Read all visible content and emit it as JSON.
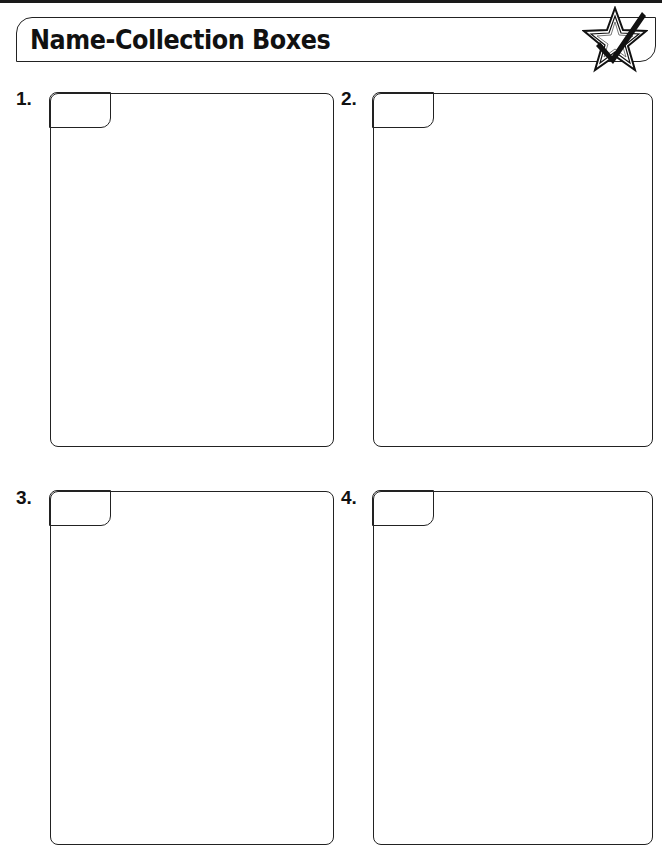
{
  "header": {
    "title": "Name-Collection Boxes",
    "icon": "star-checkmark-icon"
  },
  "boxes": [
    {
      "number": "1.",
      "name_tab": ""
    },
    {
      "number": "2.",
      "name_tab": ""
    },
    {
      "number": "3.",
      "name_tab": ""
    },
    {
      "number": "4.",
      "name_tab": ""
    }
  ],
  "colors": {
    "ink": "#111111",
    "background": "#ffffff"
  }
}
